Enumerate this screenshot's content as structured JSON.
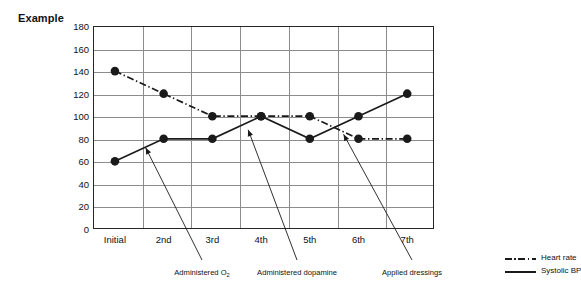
{
  "title": "Example",
  "chart_data": {
    "type": "line",
    "title": "Example",
    "xlabel": "",
    "ylabel": "",
    "categories": [
      "Initial",
      "2nd",
      "3rd",
      "4th",
      "5th",
      "6th",
      "7th"
    ],
    "ylim": [
      0,
      180
    ],
    "ytick_step": 20,
    "yticks": [
      180,
      160,
      140,
      120,
      100,
      80,
      60,
      40,
      20,
      0
    ],
    "grid": true,
    "legend_position": "bottom-right",
    "series": [
      {
        "name": "Heart rate",
        "style": "dash-dot",
        "color": "#1a1a1a",
        "marker": "filled-circle",
        "values": [
          140,
          120,
          100,
          100,
          100,
          80,
          80
        ]
      },
      {
        "name": "Systolic BP",
        "style": "solid",
        "color": "#1a1a1a",
        "marker": "filled-circle",
        "values": [
          60,
          80,
          80,
          100,
          80,
          100,
          120
        ]
      }
    ],
    "annotations": [
      {
        "text": "Administered O",
        "subscript": "2",
        "points_to_category": "2nd"
      },
      {
        "text": "Administered dopamine",
        "subscript": "",
        "points_to_category": "4th"
      },
      {
        "text": "Applied dressings",
        "subscript": "",
        "points_to_category": "6th"
      }
    ]
  },
  "legend": {
    "items": [
      {
        "label": "Heart rate",
        "style": "dash-dot"
      },
      {
        "label": "Systolic BP",
        "style": "solid"
      }
    ]
  }
}
